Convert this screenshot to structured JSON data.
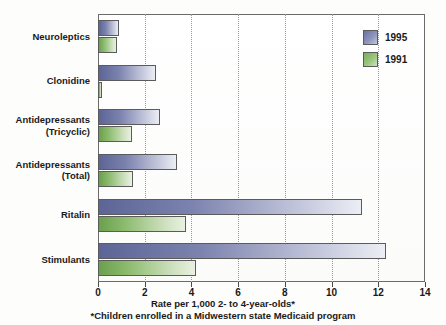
{
  "chart_data": {
    "type": "bar",
    "orientation": "horizontal",
    "title": "",
    "xlabel": "Rate per 1,000 2- to 4-year-olds*",
    "ylabel": "",
    "xlim": [
      0,
      14
    ],
    "xticks": [
      0,
      2,
      4,
      6,
      8,
      10,
      12,
      14
    ],
    "xtick_labels": [
      "0",
      "2",
      "4",
      "6",
      "8",
      "10",
      "12",
      "14"
    ],
    "grid": true,
    "grid_axis": "x",
    "legend_position": "top-right",
    "footnote": "*Children enrolled in a Midwestern state Medicaid program",
    "categories": [
      "Neuroleptics",
      "Clonidine",
      "Antidepressants (Tricyclic)",
      "Antidepressants (Total)",
      "Ritalin",
      "Stimulants"
    ],
    "series": [
      {
        "name": "1995",
        "color": "#7b82ad",
        "values": [
          0.9,
          2.5,
          2.65,
          3.4,
          11.3,
          12.35
        ]
      },
      {
        "name": "1991",
        "color": "#8cbb6e",
        "values": [
          0.8,
          0.15,
          1.45,
          1.5,
          3.75,
          4.2
        ]
      }
    ]
  },
  "axis": {
    "x_title": "Rate per 1,000 2- to 4-year-olds*",
    "ticks": [
      "0",
      "2",
      "4",
      "6",
      "8",
      "10",
      "12",
      "14"
    ]
  },
  "categories": [
    {
      "id": "neuroleptics",
      "line1": "Neuroleptics",
      "line2": ""
    },
    {
      "id": "clonidine",
      "line1": "Clonidine",
      "line2": ""
    },
    {
      "id": "antidepressants-tricyclic",
      "line1": "Antidepressants",
      "line2": "(Tricyclic)"
    },
    {
      "id": "antidepressants-total",
      "line1": "Antidepressants",
      "line2": "(Total)"
    },
    {
      "id": "ritalin",
      "line1": "Ritalin",
      "line2": ""
    },
    {
      "id": "stimulants",
      "line1": "Stimulants",
      "line2": ""
    }
  ],
  "legend": {
    "items": [
      {
        "label": "1995",
        "color": "#7b82ad"
      },
      {
        "label": "1991",
        "color": "#8cbb6e"
      }
    ]
  },
  "footnote": {
    "text": "*Children enrolled in a Midwestern state Medicaid program"
  }
}
